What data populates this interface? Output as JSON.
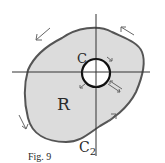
{
  "figure": {
    "caption": "Fig. 9",
    "region_label": "R",
    "inner_curve_label": "C",
    "cut_label": "C",
    "cut_label_subscript": "2",
    "colors": {
      "region_fill": "#dcdcdc",
      "outline": "#555555",
      "axes": "#333333",
      "hole_fill": "#ffffff",
      "hole_outline": "#111111",
      "arrows": "#666666"
    }
  }
}
